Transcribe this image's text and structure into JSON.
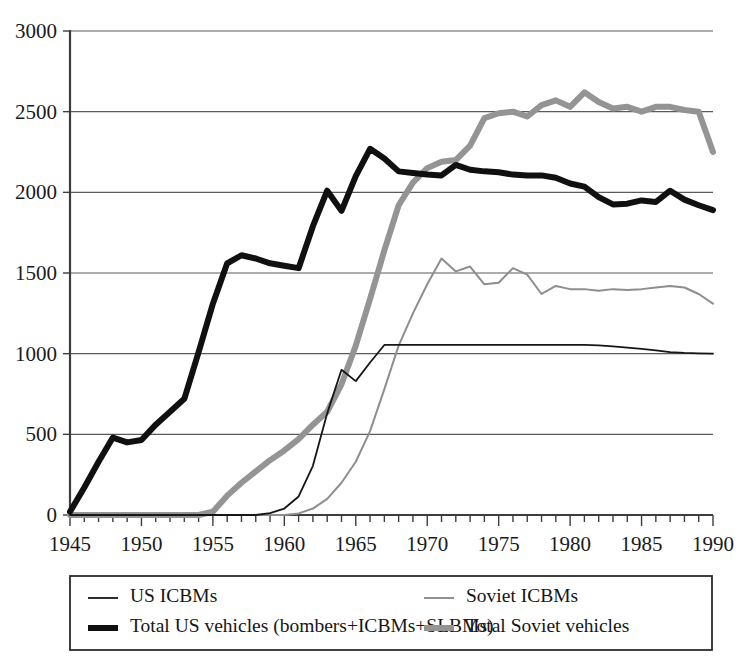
{
  "chart_data": {
    "type": "line",
    "title": "",
    "subtitle": "",
    "xlabel": "",
    "ylabel": "",
    "xlim": [
      1945,
      1990
    ],
    "ylim": [
      0,
      3000
    ],
    "grid": true,
    "grid_axis": "y",
    "legend_position": "bottom",
    "legend_columns": 2,
    "x_tick_labels": [
      "1945",
      "1950",
      "1955",
      "1960",
      "1965",
      "1970",
      "1975",
      "1980",
      "1985",
      "1990"
    ],
    "x_tick_values": [
      1945,
      1950,
      1955,
      1960,
      1965,
      1970,
      1975,
      1980,
      1985,
      1990
    ],
    "x_minor_tick_step": 1,
    "y_tick_labels": [
      "0",
      "500",
      "1000",
      "1500",
      "2000",
      "2500",
      "3000"
    ],
    "y_tick_values": [
      0,
      500,
      1000,
      1500,
      2000,
      2500,
      3000
    ],
    "x": [
      1945,
      1946,
      1947,
      1948,
      1949,
      1950,
      1951,
      1952,
      1953,
      1954,
      1955,
      1956,
      1957,
      1958,
      1959,
      1960,
      1961,
      1962,
      1963,
      1964,
      1965,
      1966,
      1967,
      1968,
      1969,
      1970,
      1971,
      1972,
      1973,
      1974,
      1975,
      1976,
      1977,
      1978,
      1979,
      1980,
      1981,
      1982,
      1983,
      1984,
      1985,
      1986,
      1987,
      1988,
      1989,
      1990
    ],
    "series": [
      {
        "name": "US ICBMs",
        "color": "#161616",
        "line_width": 1.8,
        "style": "thin-black",
        "values": [
          0,
          0,
          0,
          0,
          0,
          0,
          0,
          0,
          0,
          0,
          0,
          0,
          0,
          0,
          12,
          40,
          115,
          305,
          630,
          900,
          830,
          945,
          1054,
          1054,
          1054,
          1054,
          1054,
          1054,
          1054,
          1054,
          1054,
          1054,
          1054,
          1054,
          1054,
          1054,
          1054,
          1052,
          1045,
          1038,
          1030,
          1020,
          1010,
          1005,
          1002,
          1000
        ]
      },
      {
        "name": "Total US vehicles (bombers+ICBMs+SLBMs)",
        "color": "#101010",
        "line_width": 6.0,
        "style": "thick-black",
        "values": [
          20,
          170,
          330,
          480,
          450,
          465,
          560,
          640,
          720,
          1010,
          1310,
          1560,
          1610,
          1590,
          1560,
          1545,
          1530,
          1790,
          2010,
          1885,
          2100,
          2270,
          2210,
          2130,
          2120,
          2110,
          2105,
          2170,
          2140,
          2130,
          2125,
          2110,
          2105,
          2105,
          2090,
          2055,
          2035,
          1970,
          1925,
          1930,
          1950,
          1940,
          2010,
          1955,
          1920,
          1890
        ]
      },
      {
        "name": "Soviet ICBMs",
        "color": "#8e8e8e",
        "line_width": 2.0,
        "style": "thin-gray",
        "values": [
          0,
          0,
          0,
          0,
          0,
          0,
          0,
          0,
          0,
          0,
          0,
          0,
          0,
          0,
          0,
          0,
          10,
          40,
          100,
          200,
          330,
          520,
          780,
          1050,
          1250,
          1430,
          1590,
          1510,
          1540,
          1430,
          1440,
          1530,
          1490,
          1370,
          1420,
          1400,
          1400,
          1390,
          1400,
          1395,
          1400,
          1410,
          1420,
          1410,
          1370,
          1310
        ]
      },
      {
        "name": "Total Soviet vehicles",
        "color": "#949494",
        "line_width": 6.0,
        "style": "thick-gray",
        "values": [
          0,
          0,
          0,
          0,
          0,
          0,
          0,
          0,
          0,
          0,
          20,
          120,
          200,
          270,
          340,
          400,
          470,
          560,
          640,
          810,
          1050,
          1340,
          1640,
          1920,
          2060,
          2150,
          2190,
          2200,
          2290,
          2460,
          2490,
          2500,
          2470,
          2540,
          2570,
          2530,
          2620,
          2560,
          2520,
          2530,
          2500,
          2530,
          2530,
          2510,
          2500,
          2250
        ]
      }
    ]
  },
  "legend": {
    "entries": [
      {
        "label": "US ICBMs",
        "series_index": 0
      },
      {
        "label": "Soviet ICBMs",
        "series_index": 2
      },
      {
        "label": "Total US vehicles (bombers+ICBMs+SLBMs)",
        "series_index": 1
      },
      {
        "label": "Total Soviet vehicles",
        "series_index": 3
      }
    ]
  }
}
